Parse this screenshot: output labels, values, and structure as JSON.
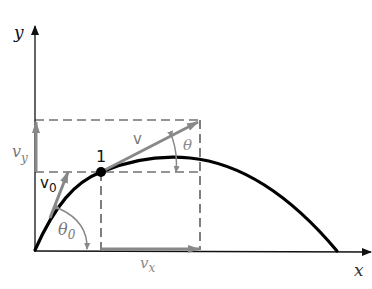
{
  "diagram": {
    "axes": {
      "x_label": "x",
      "y_label": "y"
    },
    "point": {
      "label": "1"
    },
    "vectors": {
      "v0": {
        "label": "v",
        "sub": "0"
      },
      "v": {
        "label": "v"
      },
      "vx": {
        "label": "v",
        "sub": "x"
      },
      "vy": {
        "label": "v",
        "sub": "y"
      }
    },
    "angles": {
      "theta0": {
        "label": "θ",
        "sub": "0"
      },
      "theta": {
        "label": "θ"
      }
    },
    "colors": {
      "axis": "#1a1a1a",
      "trajectory": "#000000",
      "vector": "#808080",
      "label_gray": "#7a7a7a",
      "dashed": "#2a2a2a"
    }
  }
}
